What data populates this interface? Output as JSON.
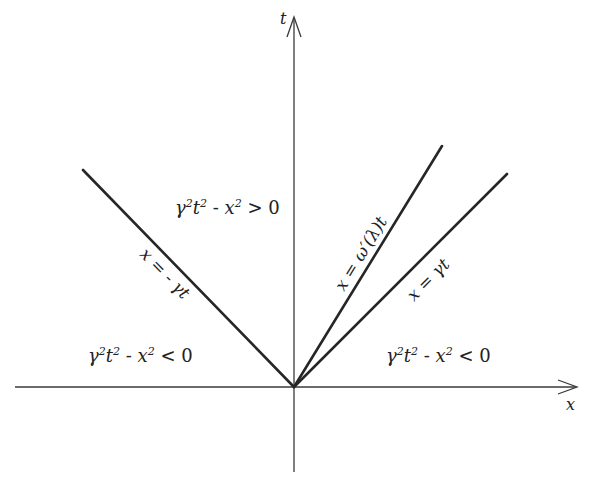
{
  "diagram": {
    "axes": {
      "horizontal": {
        "label": "x"
      },
      "vertical": {
        "label": "t"
      }
    },
    "regions": {
      "upper": {
        "lhs": "γ²t² - x²",
        "relation": ">",
        "rhs": "0"
      },
      "lower_left": {
        "lhs": "γ²t² - x²",
        "relation": "<",
        "rhs": "0"
      },
      "lower_right": {
        "lhs": "γ²t² - x²",
        "relation": "<",
        "rhs": "0"
      }
    },
    "lines": [
      {
        "id": "left-light-cone",
        "label": "x = - γt"
      },
      {
        "id": "group-velocity-line",
        "label": "x = ω′(λ)t"
      },
      {
        "id": "right-light-cone",
        "label": "x = γt"
      }
    ]
  }
}
